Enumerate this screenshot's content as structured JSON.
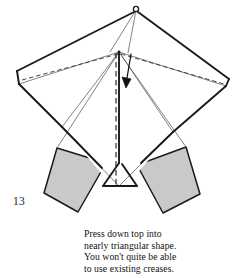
{
  "figure": {
    "step_number": "13",
    "caption_lines": [
      "Press down top into",
      "nearly triangular shape.",
      "You won't quite be able",
      "to use existing creases."
    ],
    "colors": {
      "paper_white": "#ffffff",
      "paper_shaded": "#c9c9c9",
      "outline": "#1a1a1a",
      "crease_line": "#555555",
      "dashed_crease": "#333333",
      "arrow": "#111111",
      "text": "#111111"
    },
    "diagram": {
      "type": "origami-fold-instruction",
      "apex_marker": "open-circle",
      "arrow_direction": "down",
      "arrow_meaning": "press-down",
      "shaded_flap_count": 2,
      "dashed_crease_count": 3,
      "valley_fold_style": "dashed",
      "outline_points": {
        "apex": [
          136,
          10
        ],
        "hub": [
          119,
          52
        ],
        "left_tip": [
          17,
          71
        ],
        "left_tip_lower": [
          19,
          84
        ],
        "left_bottom": [
          62,
          127
        ],
        "right_tip": [
          229,
          79
        ],
        "right_tip_lower": [
          226,
          86
        ],
        "right_bottom": [
          173,
          132
        ],
        "center_bottom": [
          119,
          186
        ]
      },
      "left_flap_points": [
        [
          57,
          148
        ],
        [
          106,
          163
        ],
        [
          78,
          212
        ],
        [
          44,
          193
        ]
      ],
      "right_flap_points": [
        [
          137,
          165
        ],
        [
          186,
          147
        ],
        [
          200,
          194
        ],
        [
          163,
          213
        ]
      ]
    }
  }
}
